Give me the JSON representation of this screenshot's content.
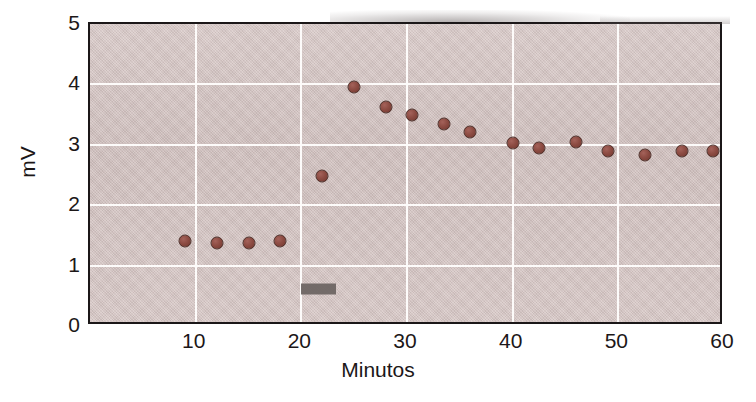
{
  "figure": {
    "background_color": "#ffffff",
    "plot_background_color": "#d5c4c2",
    "frame_color": "#1b1718",
    "grid_color": "#fdfbfa",
    "marker_color": "#8d4c43",
    "marker_edge_color": "#4a2a24",
    "stimulus_bar_color": "#6a6361"
  },
  "chart_data": {
    "type": "scatter",
    "title": "",
    "xlabel": "Minutos",
    "ylabel": "mV",
    "xlim": [
      0,
      60
    ],
    "ylim": [
      0,
      5
    ],
    "xticks": [
      10,
      20,
      30,
      40,
      50,
      60
    ],
    "yticks": [
      0,
      1,
      2,
      3,
      4,
      5
    ],
    "xtick_labels": [
      "10",
      "20",
      "30",
      "40",
      "50",
      "60"
    ],
    "ytick_labels": [
      "0",
      "1",
      "2",
      "3",
      "4",
      "5"
    ],
    "grid": true,
    "grid_x": [
      10,
      20,
      30,
      40,
      50
    ],
    "grid_y": [
      1,
      2,
      3,
      4
    ],
    "legend": null,
    "series": [
      {
        "name": "mV",
        "x": [
          9.0,
          12.0,
          15.0,
          18.0,
          22.0,
          25.0,
          28.0,
          30.5,
          33.5,
          36.0,
          40.0,
          42.5,
          46.0,
          49.0,
          52.5,
          56.0,
          59.0
        ],
        "y": [
          1.4,
          1.38,
          1.38,
          1.4,
          2.48,
          3.95,
          3.63,
          3.5,
          3.35,
          3.22,
          3.03,
          2.95,
          3.05,
          2.9,
          2.83,
          2.9,
          2.9
        ]
      }
    ],
    "annotations": [
      {
        "name": "stimulus-bar",
        "type": "bar-marker",
        "x_start": 20.0,
        "x_end": 23.3,
        "y": 0.62,
        "label": ""
      }
    ]
  }
}
